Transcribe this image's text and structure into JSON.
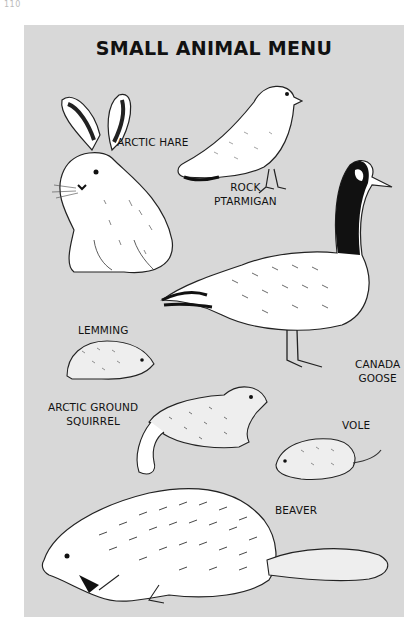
{
  "page": {
    "number": "110"
  },
  "figure": {
    "title": "SMALL ANIMAL MENU",
    "background_color": "#d8d8d8",
    "animals": [
      {
        "label_lines": [
          "ARCTIC HARE"
        ]
      },
      {
        "label_lines": [
          "ROCK",
          "PTARMIGAN"
        ]
      },
      {
        "label_lines": [
          "CANADA",
          "GOOSE"
        ]
      },
      {
        "label_lines": [
          "LEMMING"
        ]
      },
      {
        "label_lines": [
          "ARCTIC GROUND",
          "SQUIRREL"
        ]
      },
      {
        "label_lines": [
          "VOLE"
        ]
      },
      {
        "label_lines": [
          "BEAVER"
        ]
      }
    ]
  }
}
